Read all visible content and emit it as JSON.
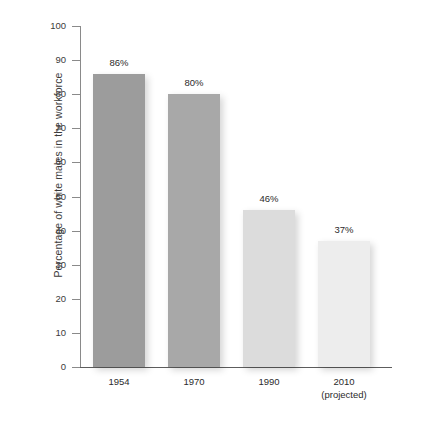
{
  "chart_data": {
    "type": "bar",
    "title": "",
    "xlabel": "",
    "ylabel": "Percentage of white males in the workforce",
    "categories": [
      "1954",
      "1970",
      "1990",
      "2010"
    ],
    "category_sublabels": [
      "",
      "",
      "",
      "(projected)"
    ],
    "values": [
      86,
      80,
      46,
      37
    ],
    "value_labels": [
      "86%",
      "80%",
      "46%",
      "37%"
    ],
    "ylim": [
      0,
      100
    ],
    "ytick_labels": [
      "100",
      "90",
      "80",
      "70",
      "60",
      "50",
      "40",
      "30",
      "20",
      "10",
      "0"
    ],
    "ytick_values": [
      100,
      90,
      80,
      70,
      60,
      50,
      40,
      30,
      20,
      10,
      0
    ],
    "grid": false,
    "legend": false,
    "bar_colors": [
      "#9c9c9c",
      "#a8a8a8",
      "#dcdcdc",
      "#ededed"
    ],
    "axis_color": "#5d5d5d",
    "text_color": "#2b2b2b"
  }
}
